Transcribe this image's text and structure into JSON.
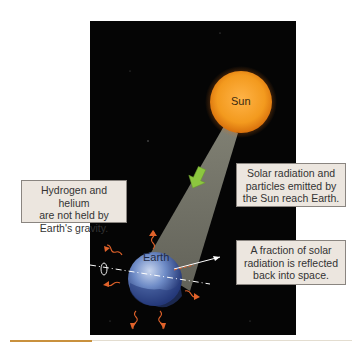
{
  "diagram": {
    "labels": {
      "sun": "Sun",
      "earth": "Earth"
    },
    "callouts": {
      "atmospheric_escape": [
        "Hydrogen and helium",
        "are not held by",
        "Earth's gravity."
      ],
      "solar_input": [
        "Solar radiation and",
        "particles emitted by",
        "the Sun reach Earth."
      ],
      "reflection": [
        "A fraction of solar",
        "radiation is reflected",
        "back into space."
      ]
    },
    "colors": {
      "background": "#050505",
      "sun": "#f39a1e",
      "beam": "#7a7a6e",
      "arrow_in": "#8cc63f",
      "escape_arrows": "#e0622a",
      "earth": "#3b5fa8",
      "callout_fill": "#ece6df"
    }
  }
}
